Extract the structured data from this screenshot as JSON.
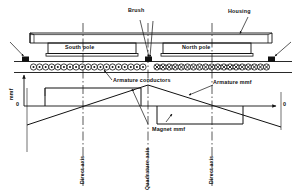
{
  "figure": {
    "type": "technical-diagram"
  },
  "machine": {
    "housing_label": "Housing",
    "brush_label": "Brush",
    "south_pole_label": "South pole",
    "north_pole_label": "North pole",
    "armature_conductors_label": "Armature conductors",
    "conductor_symbol_left": "dot-in-circle",
    "conductor_symbol_right": "cross-in-circle",
    "conductor_count_left": 19,
    "conductor_count_right": 19,
    "brush_count": 3
  },
  "plot": {
    "y_axis_label": "mmf",
    "origin_label": "0",
    "x_axis_end_label": "0",
    "armature_mmf_label": "Armature mmf",
    "magnet_mmf_label": "Magnet mmf"
  },
  "axes_lines": [
    {
      "label": "Direct axis",
      "x": 83
    },
    {
      "label": "Quadrature axis",
      "x": 148
    },
    {
      "label": "Direct axis",
      "x": 212
    }
  ],
  "colors": {
    "ink": "#111111",
    "background": "#ffffff",
    "brush_fill": "#111111"
  },
  "chart_data": {
    "type": "line",
    "xlabel": "",
    "ylabel": "mmf",
    "grid": false,
    "legend": [
      "Magnet mmf",
      "Armature mmf"
    ],
    "axis_markers": [
      "Direct axis",
      "Quadrature axis",
      "Direct axis"
    ],
    "series": [
      {
        "name": "Magnet mmf",
        "shape": "rectangular",
        "points": [
          {
            "x": 45,
            "y": 0
          },
          {
            "x": 56,
            "y": 1
          },
          {
            "x": 141,
            "y": 1
          },
          {
            "x": 141,
            "y": 0
          },
          {
            "x": 157,
            "y": 0
          },
          {
            "x": 157,
            "y": -1
          },
          {
            "x": 243,
            "y": -1
          },
          {
            "x": 243,
            "y": 0
          },
          {
            "x": 256,
            "y": 0
          }
        ]
      },
      {
        "name": "Armature mmf",
        "shape": "triangular",
        "points": [
          {
            "x": 30,
            "y": -1.05
          },
          {
            "x": 148,
            "y": 1.05
          },
          {
            "x": 281,
            "y": -1.05
          }
        ]
      }
    ]
  }
}
